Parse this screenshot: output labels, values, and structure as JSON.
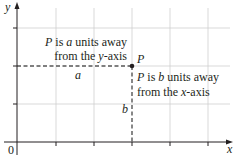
{
  "diagram": {
    "type": "coordinate-plane",
    "axes": {
      "x_label": "x",
      "y_label": "y",
      "origin_label": "0"
    },
    "point": {
      "label": "P",
      "grid_x": 3,
      "grid_y": 2
    },
    "horizontal_distance_label": "a",
    "vertical_distance_label": "b",
    "annotation_a": {
      "line1_prefix": "P",
      "line1_mid": " is ",
      "line1_var": "a",
      "line1_suffix": " units away",
      "line2_prefix": "from the ",
      "line2_var": "y",
      "line2_suffix": "-axis"
    },
    "annotation_b": {
      "line1_prefix": "P",
      "line1_mid": " is ",
      "line1_var": "b",
      "line1_suffix": " units away",
      "line2_prefix": "from the ",
      "line2_var": "x",
      "line2_suffix": "-axis"
    },
    "colors": {
      "axis": "#231f20",
      "grid": "#c8c8c8",
      "dashed": "#555555",
      "point": "#231f20",
      "text": "#231f20"
    }
  }
}
